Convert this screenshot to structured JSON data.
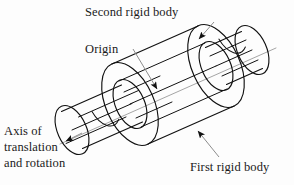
{
  "figure": {
    "type": "technical-line-diagram",
    "background_color": "#fdfdfd",
    "line_color": "#111111",
    "axis_color": "#9a9a9a",
    "text_color": "#1a1a1a"
  },
  "labels": {
    "second_rigid_body": "Second rigid body",
    "origin": "Origin",
    "first_rigid_body": "First rigid body",
    "axis": {
      "line1": "Axis of",
      "line2": "translation",
      "line3": "and rotation"
    }
  },
  "annotations": [
    {
      "name": "second-rigid-body",
      "text": "Second rigid body",
      "leader_from": [
        212,
        24
      ],
      "leader_to": [
        196,
        42
      ],
      "arrow": true
    },
    {
      "name": "origin",
      "text": "Origin",
      "leader_from": [
        134,
        50
      ],
      "leader_to": [
        159,
        92
      ],
      "arrow": true
    },
    {
      "name": "first-rigid-body",
      "text": "First rigid body",
      "leader_from": [
        218,
        156
      ],
      "leader_to": [
        196,
        128
      ],
      "arrow": true
    },
    {
      "name": "axis-of-translation-and-rotation",
      "text": "Axis of translation and rotation",
      "leader_from": [
        80,
        134
      ],
      "leader_to": [
        64,
        142
      ],
      "arrow": true
    }
  ],
  "geometry": {
    "axis": {
      "start": [
        60,
        144
      ],
      "end": [
        276,
        48
      ],
      "style": "thin-gray-solid"
    },
    "outer_tube": {
      "left_face_center": [
        130,
        104
      ],
      "right_face_center": [
        216,
        66
      ],
      "outer_radius": 44,
      "inner_radius": 26
    },
    "inner_cylinder": {
      "left_end_center": [
        72,
        130
      ],
      "right_end_center": [
        252,
        50
      ],
      "radius": 26
    }
  }
}
